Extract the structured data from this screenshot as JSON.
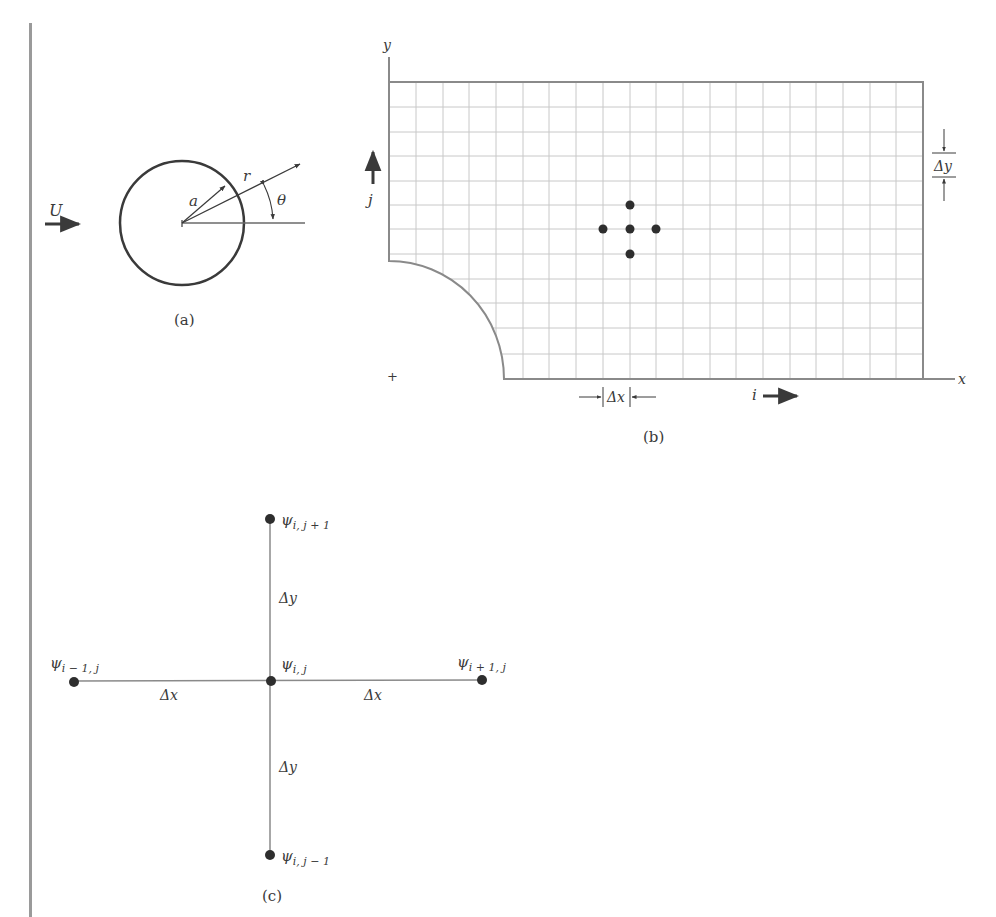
{
  "figure": {
    "panel_a": {
      "caption": "(a)",
      "labels": {
        "freestream": "U",
        "radius": "a",
        "radial": "r",
        "angle": "θ"
      }
    },
    "panel_b": {
      "caption": "(b)",
      "labels": {
        "y_axis": "y",
        "x_axis": "x",
        "j_index": "j",
        "i_index": "i",
        "dx": "Δx",
        "dy": "Δy",
        "origin_mark": "+"
      },
      "grid": {
        "columns": 20,
        "rows": 12
      }
    },
    "panel_c": {
      "caption": "(c)",
      "nodes": {
        "top": {
          "sym": "ψ",
          "sub": "i, j + 1"
        },
        "center": {
          "sym": "ψ",
          "sub": "i, j"
        },
        "left": {
          "sym": "ψ",
          "sub": "i − 1, j"
        },
        "right": {
          "sym": "ψ",
          "sub": "i + 1, j"
        },
        "bottom": {
          "sym": "ψ",
          "sub": "i, j − 1"
        }
      },
      "spacing": {
        "dx_left": "Δx",
        "dx_right": "Δx",
        "dy_top": "Δy",
        "dy_bottom": "Δy"
      }
    }
  },
  "colors": {
    "ink": "#3a3a3a",
    "line": "#8a8a8a",
    "grid": "#c8c8c8",
    "dot": "#2e2e2e",
    "bar": "#9a9a9a"
  }
}
